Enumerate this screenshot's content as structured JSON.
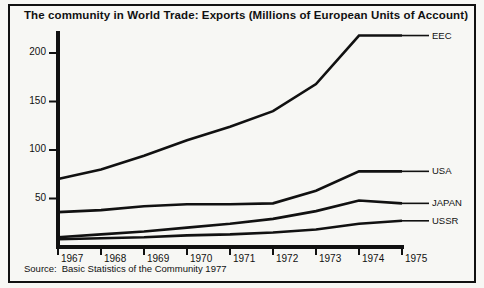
{
  "figure": {
    "title": "The community in World Trade: Exports (Millions of European Units of Account)",
    "source_label": "Source:",
    "source_text": "Basic Statistics of the Community 1977"
  },
  "chart_data": {
    "type": "line",
    "title": "The community in World Trade: Exports (Millions of European Units of Account)",
    "xlabel": "",
    "ylabel": "",
    "x": [
      1967,
      1968,
      1969,
      1970,
      1971,
      1972,
      1973,
      1974,
      1975
    ],
    "xtick_labels": [
      "1967",
      "1968",
      "1969",
      "1970",
      "1971",
      "1972",
      "1973",
      "1974",
      "1975"
    ],
    "ytick_labels": [
      "50",
      "100",
      "150",
      "200"
    ],
    "yticks": [
      50,
      100,
      150,
      200
    ],
    "xlim": [
      1967,
      1975
    ],
    "ylim": [
      0,
      230
    ],
    "grid": false,
    "legend_position": "right-inline",
    "series": [
      {
        "name": "EEC",
        "label": "EEC",
        "color": "#111111",
        "values": [
          70,
          80,
          94,
          110,
          124,
          140,
          168,
          218,
          218
        ]
      },
      {
        "name": "USA",
        "label": "USA",
        "color": "#111111",
        "values": [
          36,
          38,
          42,
          44,
          44,
          45,
          58,
          78,
          78
        ]
      },
      {
        "name": "JAPAN",
        "label": "JAPAN",
        "color": "#111111",
        "values": [
          10,
          13,
          16,
          20,
          24,
          29,
          37,
          48,
          45
        ]
      },
      {
        "name": "USSR",
        "label": "USSR",
        "color": "#111111",
        "values": [
          8,
          9,
          10,
          12,
          13,
          15,
          18,
          24,
          27
        ]
      }
    ]
  }
}
